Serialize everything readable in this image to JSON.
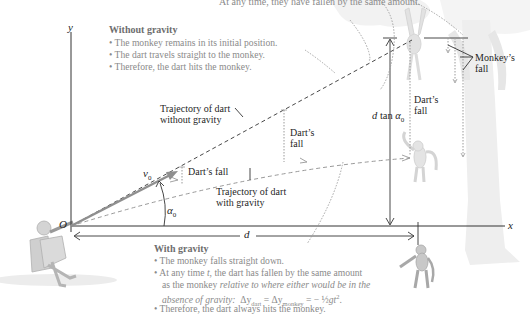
{
  "top_caption": "At any time, they have fallen by the same amount.",
  "axes": {
    "y": "y",
    "x": "x",
    "origin": "O"
  },
  "without_gravity": {
    "heading": "Without gravity",
    "bullets": [
      "• The monkey remains in its initial position.",
      "• The dart travels straight to the monkey.",
      "• Therefore, the dart hits the monkey."
    ]
  },
  "with_gravity": {
    "heading": "With gravity",
    "bullets": [
      "• The monkey falls straight down.",
      "• At any time t, the dart has fallen by the same amount",
      "as the monkey relative to where either would be in the",
      "absence of gravity: Δy",
      "• Therefore, the dart always hits the monkey."
    ],
    "line2_prefix": "• At any time ",
    "line2_t": "t",
    "line2_suffix": ", the dart has fallen by the same amount",
    "line3_prefix": "as the monkey ",
    "line3_italic": "relative to where either would be in the",
    "line4_italic": "absence of gravity:",
    "equation": {
      "dy": "Δy",
      "sub_dart": "dart",
      "eq1": " = Δy",
      "sub_monkey": "monkey",
      "eq2": " = −",
      "half": "½",
      "gt": "gt",
      "exp": "2",
      "end": "."
    }
  },
  "labels": {
    "traj_without_1": "Trajectory of dart",
    "traj_without_2": "without gravity",
    "traj_with_1": "Trajectory of dart",
    "traj_with_2": "with gravity",
    "darts_fall_small": "Dart’s fall",
    "darts_fall_mid_1": "Dart’s",
    "darts_fall_mid_2": "fall",
    "darts_fall_right_1": "Dart’s",
    "darts_fall_right_2": "fall",
    "monkeys_fall_1": "Monkey’s",
    "monkeys_fall_2": "fall",
    "v0": "v",
    "v0_sub": "0",
    "alpha0": "α",
    "alpha0_sub": "0",
    "d": "d",
    "dtan_prefix": "d",
    "dtan_mid": " tan ",
    "dtan_alpha": "α",
    "dtan_sub": "0"
  },
  "colors": {
    "dart_gray": "#8f8f8f",
    "axis": "#333333",
    "tree": "#e8e8e8",
    "figure_gray": "#bdbdbd"
  }
}
